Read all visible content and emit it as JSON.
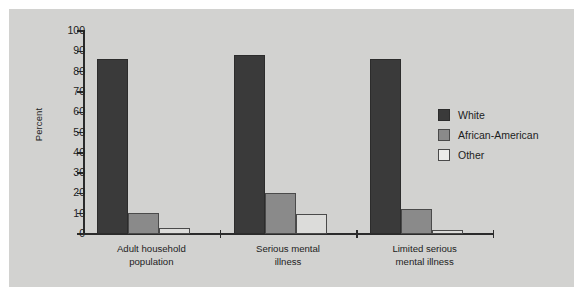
{
  "chart_data": {
    "type": "bar",
    "title": "",
    "xlabel": "",
    "ylabel": "Percent",
    "ylim": [
      0,
      100
    ],
    "ytick_labels": [
      "100",
      "90",
      "80",
      "70",
      "60",
      "50",
      "40",
      "30",
      "20",
      "10",
      "0"
    ],
    "yticks": [
      100,
      90,
      80,
      70,
      60,
      50,
      40,
      30,
      20,
      10,
      0
    ],
    "grid": false,
    "legend_position": "right",
    "categories": [
      "Adult household population",
      "Serious mental illness",
      "Limited serious mental illness"
    ],
    "category_lines": [
      [
        "Adult household",
        "population"
      ],
      [
        "Serious mental",
        "illness"
      ],
      [
        "Limited serious",
        "mental illness"
      ]
    ],
    "series": [
      {
        "name": "White",
        "color": "#3a3a3a",
        "values": [
          86,
          88,
          86
        ]
      },
      {
        "name": "African-American",
        "color": "#8a8a8a",
        "values": [
          10.5,
          20,
          12.5
        ]
      },
      {
        "name": "Other",
        "color": "#dcdcda",
        "values": [
          3,
          10,
          2
        ]
      }
    ]
  },
  "legend": {
    "entries": [
      {
        "label": "White"
      },
      {
        "label": "African-American"
      },
      {
        "label": "Other"
      }
    ]
  },
  "colors": {
    "figure_background": "#d2d2d0",
    "axis": "#2b2b2b",
    "text": "#1d1d1d",
    "series_white": "#3a3a3a",
    "series_african_american": "#8a8a8a",
    "series_other": "#dcdcda"
  }
}
